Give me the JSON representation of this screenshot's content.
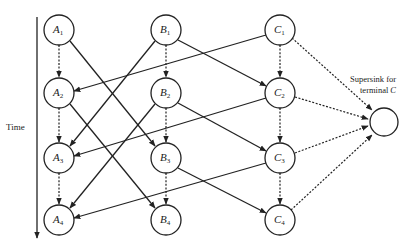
{
  "diagram": {
    "time_axis": {
      "label": "Time"
    },
    "supersink": {
      "label_line1": "Supersink for",
      "label_line2": "terminal",
      "label_terminal": "C"
    },
    "nodes": [
      {
        "id": "A1",
        "letter": "A",
        "sub": "1"
      },
      {
        "id": "A2",
        "letter": "A",
        "sub": "2"
      },
      {
        "id": "A3",
        "letter": "A",
        "sub": "3"
      },
      {
        "id": "A4",
        "letter": "A",
        "sub": "4"
      },
      {
        "id": "B1",
        "letter": "B",
        "sub": "1"
      },
      {
        "id": "B2",
        "letter": "B",
        "sub": "2"
      },
      {
        "id": "B3",
        "letter": "B",
        "sub": "3"
      },
      {
        "id": "B4",
        "letter": "B",
        "sub": "4"
      },
      {
        "id": "C1",
        "letter": "C",
        "sub": "1"
      },
      {
        "id": "C2",
        "letter": "C",
        "sub": "2"
      },
      {
        "id": "C3",
        "letter": "C",
        "sub": "3"
      },
      {
        "id": "C4",
        "letter": "C",
        "sub": "4"
      }
    ],
    "edges_solid": [
      [
        "A1",
        "B3"
      ],
      [
        "A2",
        "B4"
      ],
      [
        "B1",
        "A3"
      ],
      [
        "B2",
        "A4"
      ],
      [
        "B1",
        "C2"
      ],
      [
        "B2",
        "C3"
      ],
      [
        "B3",
        "C4"
      ],
      [
        "C1",
        "A2"
      ],
      [
        "C2",
        "A3"
      ],
      [
        "C3",
        "A4"
      ]
    ],
    "edges_dashed": [
      [
        "A1",
        "A2"
      ],
      [
        "A2",
        "A3"
      ],
      [
        "A3",
        "A4"
      ],
      [
        "B1",
        "B2"
      ],
      [
        "B2",
        "B3"
      ],
      [
        "B3",
        "B4"
      ],
      [
        "C1",
        "C2"
      ],
      [
        "C2",
        "C3"
      ],
      [
        "C3",
        "C4"
      ],
      [
        "C1",
        "SINK"
      ],
      [
        "C2",
        "SINK"
      ],
      [
        "C3",
        "SINK"
      ],
      [
        "C4",
        "SINK"
      ]
    ]
  }
}
